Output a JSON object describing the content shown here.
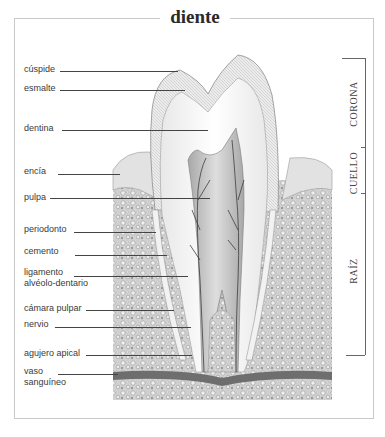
{
  "title": "diente",
  "labels": [
    {
      "id": "cuspide",
      "text": "cúspide"
    },
    {
      "id": "esmalte",
      "text": "esmalte"
    },
    {
      "id": "dentina",
      "text": "dentina"
    },
    {
      "id": "encia",
      "text": "encía"
    },
    {
      "id": "pulpa",
      "text": "pulpa"
    },
    {
      "id": "periodonto",
      "text": "periodonto"
    },
    {
      "id": "cemento",
      "text": "cemento"
    },
    {
      "id": "ligamento",
      "line1": "ligamento",
      "line2": "alvéolo-dentario"
    },
    {
      "id": "camara-pulpar",
      "text": "cámara pulpar"
    },
    {
      "id": "nervio",
      "text": "nervio"
    },
    {
      "id": "agujero-apical",
      "text": "agujero apical"
    },
    {
      "id": "vaso-sanguineo",
      "line1": "vaso",
      "line2": "sanguíneo"
    }
  ],
  "sections": [
    {
      "id": "corona",
      "text": "CORONA"
    },
    {
      "id": "cuello",
      "text": "CUELLO"
    },
    {
      "id": "raiz",
      "text": "RAÍZ"
    }
  ],
  "colors": {
    "frame": "#c9c9c9",
    "text": "#3a3a3a",
    "leader": "#444444",
    "enamel": "#e4e4e4",
    "dentin": "#f7f7f7",
    "pulp": "#cfcfcf",
    "bone": "#bdbdbd",
    "gum": "#d6d6d6"
  }
}
